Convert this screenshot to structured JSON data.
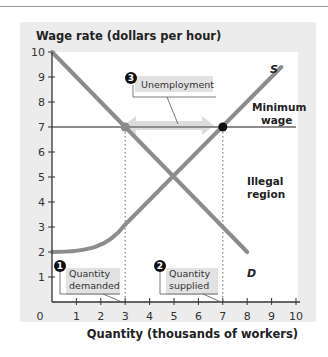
{
  "chart_data": {
    "type": "line",
    "title": "",
    "ylabel": "Wage rate (dollars per hour)",
    "xlabel": "Quantity (thousands of workers)",
    "xlim": [
      0,
      10
    ],
    "ylim": [
      0,
      10
    ],
    "x_ticks": [
      "0",
      "1",
      "2",
      "3",
      "4",
      "5",
      "6",
      "7",
      "8",
      "9",
      "10"
    ],
    "y_ticks": [
      "1",
      "2",
      "3",
      "4",
      "5",
      "6",
      "7",
      "8",
      "9",
      "10"
    ],
    "grid": false,
    "series": [
      {
        "name": "D",
        "label": "D",
        "points": [
          [
            0,
            10
          ],
          [
            8,
            2
          ]
        ]
      },
      {
        "name": "S",
        "label": "S",
        "points": [
          [
            0,
            2
          ],
          [
            1,
            2.05
          ],
          [
            2,
            2.4
          ],
          [
            3,
            3.2
          ],
          [
            4,
            4.2
          ],
          [
            5,
            5.0
          ],
          [
            7,
            7.0
          ],
          [
            9.4,
            9.4
          ]
        ]
      },
      {
        "name": "Minimum wage",
        "points": [
          [
            0,
            7
          ],
          [
            10,
            7
          ]
        ]
      }
    ],
    "points": [
      {
        "name": "quantity demanded at minimum wage",
        "x": 3,
        "y": 7,
        "color": "#8a8a8a"
      },
      {
        "name": "quantity supplied at minimum wage",
        "x": 7,
        "y": 7,
        "color": "#111111"
      }
    ],
    "annotations": [
      {
        "number": "1",
        "text": [
          "Quantity",
          "demanded"
        ]
      },
      {
        "number": "2",
        "text": [
          "Quantity",
          "supplied"
        ]
      },
      {
        "number": "3",
        "text": [
          "Unemployment"
        ]
      },
      {
        "text": [
          "Minimum",
          "wage"
        ]
      },
      {
        "text": [
          "Illegal",
          "region"
        ]
      }
    ]
  },
  "labels": {
    "ylabel": "Wage rate (dollars per hour)",
    "xlabel": "Quantity (thousands of workers)",
    "zero": "0",
    "curve_d": "D",
    "curve_s": "S",
    "min_wage_1": "Minimum",
    "min_wage_2": "wage",
    "illegal_1": "Illegal",
    "illegal_2": "region",
    "callout1_num": "1",
    "callout1_l1": "Quantity",
    "callout1_l2": "demanded",
    "callout2_num": "2",
    "callout2_l1": "Quantity",
    "callout2_l2": "supplied",
    "callout3_num": "3",
    "callout3_l1": "Unemployment"
  },
  "colors": {
    "panel": "#ececec",
    "plot": "#ffffff",
    "curve": "#8c8c8c",
    "axis": "#333333",
    "arrow": "#d8d8d8"
  }
}
